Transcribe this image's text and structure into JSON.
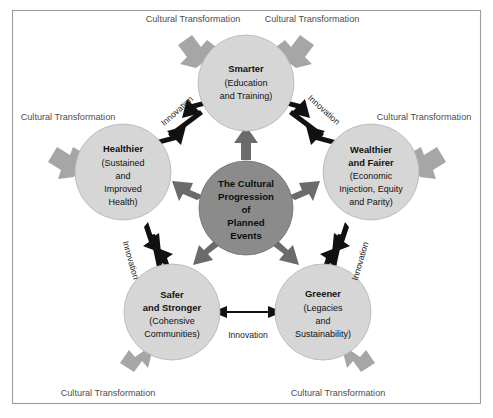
{
  "diagram": {
    "title_center": {
      "lines": [
        "The Cultural",
        "Progression",
        "of",
        "Planned",
        "Events"
      ]
    },
    "colors": {
      "node_fill": "#d6d6d6",
      "center_fill": "#8b8b8b",
      "outer_arrow": "#a6a6a6",
      "inner_arrow_dark": "#6b6b6b",
      "link_arrow": "#111111",
      "frame_border": "#9d9d9d",
      "background": "#ffffff"
    },
    "nodes": [
      {
        "id": "smarter",
        "title": "Smarter",
        "sub_lines": [
          "(Education",
          "and Training)"
        ],
        "cx": 246,
        "cy": 83,
        "r": 48
      },
      {
        "id": "wealthier",
        "title_lines": [
          "Wealthier",
          "and Fairer"
        ],
        "title": "Wealthier and Fairer",
        "sub_lines": [
          "(Economic",
          "Injection, Equity",
          "and Parity)"
        ],
        "cx": 371,
        "cy": 172,
        "r": 48
      },
      {
        "id": "greener",
        "title": "Greener",
        "sub_lines": [
          "(Legacies",
          "and",
          "Sustainability)"
        ],
        "cx": 323,
        "cy": 312,
        "r": 48
      },
      {
        "id": "safer",
        "title_lines": [
          "Safer",
          "and Stronger"
        ],
        "title": "Safer and Stronger",
        "sub_lines": [
          "(Cohensive",
          "Communities)"
        ],
        "cx": 172,
        "cy": 312,
        "r": 48
      },
      {
        "id": "healthier",
        "title": "Healthier",
        "sub_lines": [
          "(Sustained",
          "and",
          "Improved",
          "Health)"
        ],
        "cx": 123,
        "cy": 172,
        "r": 48
      }
    ],
    "center_node": {
      "id": "center",
      "cx": 246,
      "cy": 208,
      "r": 47
    },
    "outer_labels": [
      {
        "id": "ct-top-left",
        "text": "Cultural Transformation",
        "x": 193,
        "y": 22
      },
      {
        "id": "ct-top-right",
        "text": "Cultural Transformation",
        "x": 312,
        "y": 22
      },
      {
        "id": "ct-left",
        "text": "Cultural Transformation",
        "x": 68,
        "y": 120
      },
      {
        "id": "ct-right",
        "text": "Cultural Transformation",
        "x": 424,
        "y": 120
      },
      {
        "id": "ct-bottom-left",
        "text": "Cultural Transformation",
        "x": 108,
        "y": 396
      },
      {
        "id": "ct-bottom-right",
        "text": "Cultural Transformation",
        "x": 338,
        "y": 396
      }
    ],
    "inner_labels": [
      {
        "id": "innovation-healthier-smarter",
        "text": "Innovation",
        "x": 179,
        "y": 113,
        "rotate": -42
      },
      {
        "id": "innovation-smarter-wealthier",
        "text": "Innovation",
        "x": 322,
        "y": 112,
        "rotate": 42
      },
      {
        "id": "innovation-wealthier-greener",
        "text": "Innovation",
        "x": 363,
        "y": 262,
        "rotate": -74
      },
      {
        "id": "innovation-greener-safer",
        "text": "Innovation",
        "x": 248,
        "y": 338,
        "rotate": 0
      },
      {
        "id": "innovation-safer-healthier",
        "text": "Innovation",
        "x": 128,
        "y": 261,
        "rotate": 74
      }
    ]
  }
}
